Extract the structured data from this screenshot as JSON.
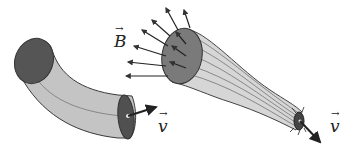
{
  "diagram": {
    "left_tube": {
      "velocity_label": "v",
      "colors": {
        "body": "#c2c2c2",
        "end_cap": "#555555",
        "outline": "#3a3a3a"
      }
    },
    "right_tube": {
      "field_label": "B",
      "velocity_label": "v",
      "colors": {
        "body": "#d6d6d6",
        "end_cap": "#7a7a7a",
        "field_lines": "#555555",
        "arrows": "#222222"
      }
    }
  }
}
